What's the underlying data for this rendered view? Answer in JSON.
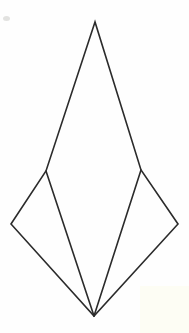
{
  "figure": {
    "shape_type": "line-drawing",
    "canvas": {
      "width": 189,
      "height": 333
    },
    "background_color": "#fefefe",
    "stroke_color": "#2b2b2b",
    "stroke_width": 1.6,
    "fill": "none",
    "vertices": {
      "apex": {
        "label": "apex",
        "x": 95,
        "y": 22
      },
      "left_shoulder": {
        "label": "left-shoulder",
        "x": 46,
        "y": 171
      },
      "right_shoulder": {
        "label": "right-shoulder",
        "x": 141,
        "y": 170
      },
      "left_tip": {
        "label": "left-tip",
        "x": 11,
        "y": 224
      },
      "right_tip": {
        "label": "right-tip",
        "x": 178,
        "y": 224
      },
      "bottom": {
        "label": "bottom-point",
        "x": 94,
        "y": 316
      }
    },
    "paths": {
      "outer_outline": "M 95 22 L 46 171 L 11 224 L 94 316 L 178 224 L 141 170 Z",
      "central_triangle_left_edge": "M 46 171 L 94 316",
      "central_triangle_right_edge": "M 141 170 L 94 316"
    },
    "edges": [
      {
        "name": "apex-to-left-shoulder",
        "from": "apex",
        "to": "left_shoulder"
      },
      {
        "name": "apex-to-right-shoulder",
        "from": "apex",
        "to": "right_shoulder"
      },
      {
        "name": "left-shoulder-to-left-tip",
        "from": "left_shoulder",
        "to": "left_tip"
      },
      {
        "name": "right-shoulder-to-right-tip",
        "from": "right_shoulder",
        "to": "right_tip"
      },
      {
        "name": "left-tip-to-bottom",
        "from": "left_tip",
        "to": "bottom"
      },
      {
        "name": "right-tip-to-bottom",
        "from": "right_tip",
        "to": "bottom"
      },
      {
        "name": "left-shoulder-to-bottom",
        "from": "left_shoulder",
        "to": "bottom"
      },
      {
        "name": "right-shoulder-to-bottom",
        "from": "right_shoulder",
        "to": "bottom"
      }
    ],
    "artifacts": {
      "speck": {
        "color": "#e2e2e0",
        "x": 3,
        "y": 16,
        "width": 7,
        "height": 5
      },
      "corner_tint": {
        "color": "#fdfdf4",
        "x": 140,
        "y": 286,
        "width": 49,
        "height": 47
      }
    }
  }
}
